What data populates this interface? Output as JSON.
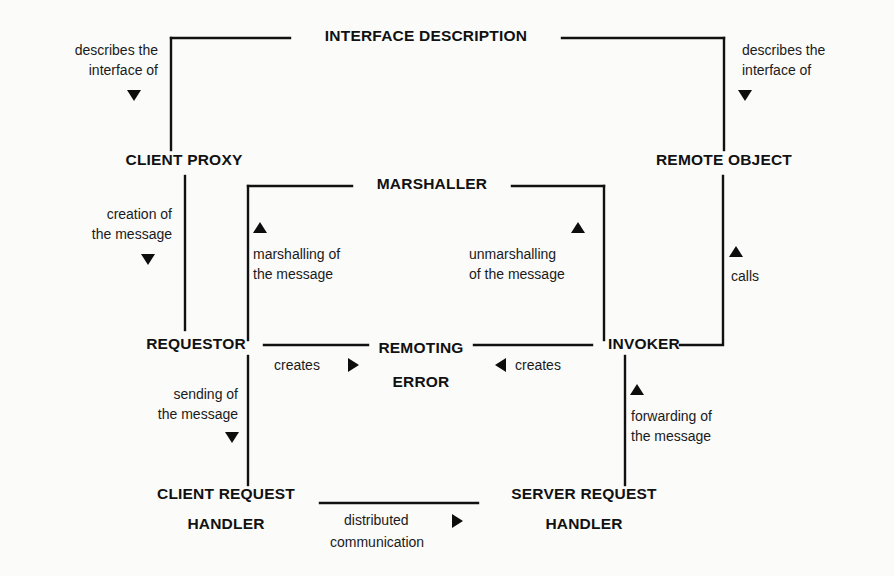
{
  "diagram": {
    "background_color": "#fbfbfa",
    "line_color": "#111111",
    "text_color": "#111111",
    "nodes": [
      {
        "id": "interface_description",
        "label": "INTERFACE DESCRIPTION"
      },
      {
        "id": "client_proxy",
        "label": "CLIENT PROXY"
      },
      {
        "id": "remote_object",
        "label": "REMOTE OBJECT"
      },
      {
        "id": "marshaller",
        "label": "MARSHALLER"
      },
      {
        "id": "requestor",
        "label": "REQUESTOR"
      },
      {
        "id": "invoker",
        "label": "INVOKER"
      },
      {
        "id": "remoting_error_line1",
        "label": "REMOTING"
      },
      {
        "id": "remoting_error_line2",
        "label": "ERROR"
      },
      {
        "id": "client_request_handler_line1",
        "label": "CLIENT REQUEST"
      },
      {
        "id": "client_request_handler_line2",
        "label": "HANDLER"
      },
      {
        "id": "server_request_handler_line1",
        "label": "SERVER REQUEST"
      },
      {
        "id": "server_request_handler_line2",
        "label": "HANDLER"
      }
    ],
    "edge_labels": {
      "describes_left_line1": "describes the",
      "describes_left_line2": "interface of",
      "describes_right_line1": "describes the",
      "describes_right_line2": "interface of",
      "creation_line1": "creation of",
      "creation_line2": "the message",
      "marshalling_line1": "marshalling of",
      "marshalling_line2": "the message",
      "unmarshalling_line1": "unmarshalling",
      "unmarshalling_line2": "of the message",
      "calls": "calls",
      "creates_left": "creates",
      "creates_right": "creates",
      "sending_line1": "sending of",
      "sending_line2": "the message",
      "forwarding_line1": "forwarding of",
      "forwarding_line2": "the message",
      "distributed_line1": "distributed",
      "distributed_line2": "communication"
    }
  }
}
